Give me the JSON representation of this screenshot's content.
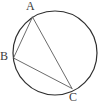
{
  "figure": {
    "canvas": {
      "width": 105,
      "height": 106,
      "background": "#ffffff"
    },
    "circle": {
      "name": "circumscribed-circle",
      "cx": 55,
      "cy": 53,
      "r": 42,
      "stroke": "#2e2e2e",
      "stroke_width": 1.2,
      "fill": "none"
    },
    "points": [
      {
        "id": "A",
        "label": "A",
        "x": 32.5,
        "y": 17.0,
        "label_x": 26,
        "label_y": 0
      },
      {
        "id": "B",
        "label": "B",
        "x": 13.5,
        "y": 58.0,
        "label_x": 0,
        "label_y": 50
      },
      {
        "id": "C",
        "label": "C",
        "x": 72.0,
        "y": 88.5,
        "label_x": 69,
        "label_y": 91
      }
    ],
    "chords": [
      {
        "id": "AB",
        "from": "A",
        "to": "B",
        "x1": 32.5,
        "y1": 17.0,
        "x2": 13.5,
        "y2": 58.0
      },
      {
        "id": "AC",
        "from": "A",
        "to": "C",
        "x1": 32.5,
        "y1": 17.0,
        "x2": 72.0,
        "y2": 88.5
      },
      {
        "id": "BC",
        "from": "B",
        "to": "C",
        "x1": 13.5,
        "y1": 58.0,
        "x2": 72.0,
        "y2": 88.5
      }
    ],
    "chord_style": {
      "stroke": "#5a5a5a",
      "stroke_width": 0.9
    },
    "label_style": {
      "color": "#3b3b3b",
      "font_size": 12
    }
  }
}
